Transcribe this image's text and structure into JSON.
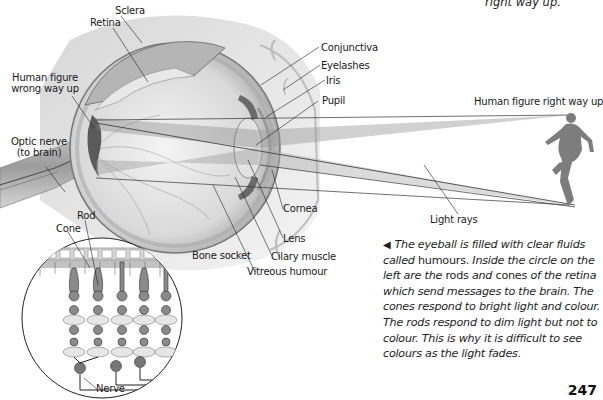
{
  "diagram": {
    "title_fragment": "right way up.",
    "labels": {
      "sclera": "Sclera",
      "retina": "Retina",
      "human_figure_wrong": [
        "Human figure",
        "wrong way up"
      ],
      "optic_nerve": [
        "Optic nerve",
        "(to brain)"
      ],
      "conjunctiva": "Conjunctiva",
      "eyelashes": "Eyelashes",
      "iris": "Iris",
      "pupil": "Pupil",
      "human_figure_right": "Human figure right way up",
      "cornea": "Cornea",
      "lens": "Lens",
      "light_rays": "Light rays",
      "bone_socket": "Bone socket",
      "ciliary_muscle": "Cilary muscle",
      "vitreous_humour": "Vitreous humour",
      "rod": "Rod",
      "cone": "Cone",
      "nerve": "Nerve"
    },
    "caption": {
      "arrow": "◀",
      "segments": [
        {
          "text": "The eyeball is filled with clear fluids called",
          "italic": true
        },
        {
          "text": " humours. ",
          "italic": false
        },
        {
          "text": "Inside the circle on the left are the",
          "italic": true
        },
        {
          "text": " rods ",
          "italic": false
        },
        {
          "text": "and",
          "italic": true
        },
        {
          "text": " cones ",
          "italic": false
        },
        {
          "text": "of the retina which send messages to the brain. The cones respond to bright light and colour. The rods respond to dim light but not to colour. This is why it is difficult to see colours as the light fades.",
          "italic": true
        }
      ]
    },
    "page_number": "247"
  }
}
